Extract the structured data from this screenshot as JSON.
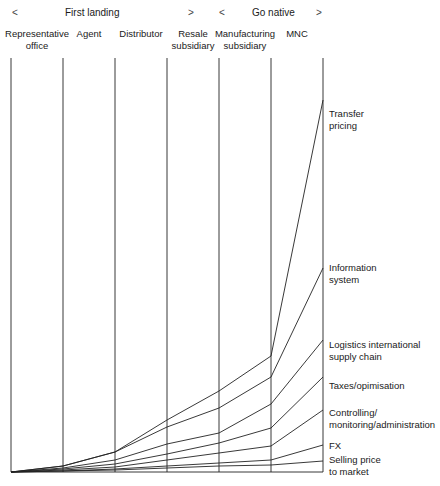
{
  "header": {
    "phase_first": {
      "label": "First landing",
      "arrow_left": "<",
      "arrow_right": ">"
    },
    "phase_second": {
      "label": "Go native",
      "arrow_left": "<",
      "arrow_right": ">"
    }
  },
  "columns": [
    {
      "label": "Representative\noffice",
      "x": 11
    },
    {
      "label": "Agent",
      "x": 63
    },
    {
      "label": "Distributor",
      "x": 115
    },
    {
      "label": "Resale\nsubsidiary",
      "x": 167
    },
    {
      "label": "Manufacturing\nsubsidiary",
      "x": 219
    },
    {
      "label": "MNC",
      "x": 271
    },
    {
      "label": "",
      "x": 323
    }
  ],
  "cost_labels": [
    {
      "label": "Transfer\npricing",
      "y": 108
    },
    {
      "label": "Information\nsystem",
      "y": 262
    },
    {
      "label": "Logistics international\nsupply chain",
      "y": 339
    },
    {
      "label": "Taxes/opimisation",
      "y": 380
    },
    {
      "label": "Controlling/\nmonitoring/administration",
      "y": 407
    },
    {
      "label": "FX",
      "y": 440
    },
    {
      "label": "Selling price\nto market",
      "y": 454
    }
  ],
  "chart_data": {
    "type": "line",
    "title": "",
    "xlabel": "",
    "ylabel": "",
    "categories": [
      "Representative office",
      "Agent",
      "Distributor",
      "Resale subsidiary",
      "Manufacturing subsidiary",
      "MNC",
      "End"
    ],
    "phase_groups": [
      {
        "label": "First landing",
        "span": [
          "Representative office",
          "Resale subsidiary"
        ]
      },
      {
        "label": "Go native",
        "span": [
          "Manufacturing subsidiary",
          "MNC"
        ]
      }
    ],
    "baseline_y": 472,
    "series": [
      {
        "name": "Transfer pricing",
        "y_pixels": [
          472,
          466,
          452,
          420,
          391,
          356,
          100
        ]
      },
      {
        "name": "Information system",
        "y_pixels": [
          472,
          466,
          452,
          427,
          408,
          377,
          268
        ]
      },
      {
        "name": "Logistics international supply chain",
        "y_pixels": [
          472,
          468,
          460,
          444,
          433,
          404,
          340
        ]
      },
      {
        "name": "Taxes/opimisation",
        "y_pixels": [
          472,
          469,
          464,
          454,
          443,
          428,
          377
        ]
      },
      {
        "name": "Controlling/monitoring/administration",
        "y_pixels": [
          472,
          470,
          467,
          460,
          453,
          446,
          410
        ]
      },
      {
        "name": "FX",
        "y_pixels": [
          472,
          471,
          469,
          466,
          463,
          460,
          445
        ]
      },
      {
        "name": "Selling price to market",
        "y_pixels": [
          472,
          471,
          470,
          468,
          466,
          465,
          461
        ]
      }
    ],
    "grid": false,
    "legend": "right-side inline labels"
  },
  "style": {
    "line_color": "#222222",
    "text_color": "#1a1a1a"
  }
}
